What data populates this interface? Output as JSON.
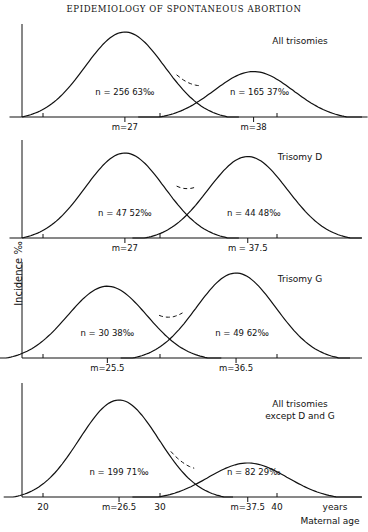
{
  "page_title": "EPIDEMIOLOGY OF SPONTANEOUS ABORTION",
  "y_axis_label": "Incidence ‰",
  "x_axis": {
    "unit_label": "years",
    "title": "Maternal age",
    "ticks": [
      20,
      30,
      40
    ]
  },
  "chart_data": [
    {
      "type": "line",
      "title": "All trisomies",
      "xlabel": "Maternal age (years)",
      "ylabel": "Incidence ‰",
      "series": [
        {
          "name": "younger group",
          "mean": 27,
          "n": 256,
          "percent": "63‰",
          "relative_peak": 1.0
        },
        {
          "name": "older group",
          "mean": 38,
          "n": 165,
          "percent": "37‰",
          "relative_peak": 0.55
        }
      ],
      "dashed_sum_between_modes": true
    },
    {
      "type": "line",
      "title": "Trisomy D",
      "xlabel": "Maternal age (years)",
      "ylabel": "Incidence ‰",
      "series": [
        {
          "name": "younger group",
          "mean": 27,
          "n": 47,
          "percent": "52‰",
          "relative_peak": 1.0
        },
        {
          "name": "older group",
          "mean": 37.5,
          "n": 44,
          "percent": "48‰",
          "relative_peak": 0.96
        }
      ],
      "dashed_sum_between_modes": true
    },
    {
      "type": "line",
      "title": "Trisomy G",
      "xlabel": "Maternal age (years)",
      "ylabel": "Incidence ‰",
      "series": [
        {
          "name": "younger group",
          "mean": 25.5,
          "n": 30,
          "percent": "38‰",
          "relative_peak": 0.85
        },
        {
          "name": "older group",
          "mean": 36.5,
          "n": 49,
          "percent": "62‰",
          "relative_peak": 1.0
        }
      ],
      "dashed_sum_between_modes": true
    },
    {
      "type": "line",
      "title": "All trisomies except D and G",
      "xlabel": "Maternal age (years)",
      "ylabel": "Incidence ‰",
      "series": [
        {
          "name": "younger group",
          "mean": 26.5,
          "n": 199,
          "percent": "71‰",
          "relative_peak": 1.0
        },
        {
          "name": "older group",
          "mean": 37.5,
          "n": 82,
          "percent": "29‰",
          "relative_peak": 0.37
        }
      ],
      "dashed_sum_between_modes": true
    }
  ],
  "panels": [
    {
      "title": "All trisomies",
      "title2": "",
      "m1": "m=27",
      "m2": "m=38",
      "l1": "n = 256    63‰",
      "l2": "n = 165    37‰"
    },
    {
      "title": "Trisomy D",
      "title2": "",
      "m1": "m=27",
      "m2": "m = 37.5",
      "l1": "n = 47    52‰",
      "l2": "n = 44    48‰"
    },
    {
      "title": "Trisomy G",
      "title2": "",
      "m1": "m=25.5",
      "m2": "m=36.5",
      "l1": "n = 30    38‰",
      "l2": "n = 49    62‰"
    },
    {
      "title": "All trisomies",
      "title2": "except D and G",
      "m1": "m=26.5",
      "m2": "m=37.5",
      "l1": "n = 199    71‰",
      "l2": "n = 82    29‰"
    }
  ]
}
